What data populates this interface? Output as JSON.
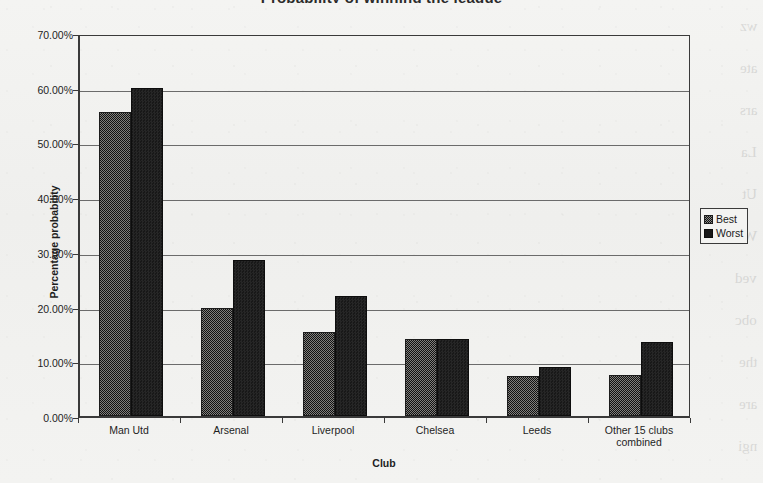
{
  "chart_data": {
    "type": "bar",
    "title": "Probability of winning the league",
    "xlabel": "Club",
    "ylabel": "Percentage probability",
    "categories": [
      "Man Utd",
      "Arsenal",
      "Liverpool",
      "Chelsea",
      "Leeds",
      "Other 15 clubs combined"
    ],
    "series": [
      {
        "name": "Best",
        "values": [
          55.5,
          19.8,
          15.3,
          14.1,
          7.4,
          7.5
        ]
      },
      {
        "name": "Worst",
        "values": [
          60.0,
          28.5,
          22.0,
          14.1,
          8.9,
          13.5
        ]
      }
    ],
    "ylim": [
      0,
      70
    ],
    "y_tick_labels": [
      "0.00%",
      "10.00%",
      "20.00%",
      "30.00%",
      "40.00%",
      "50.00%",
      "60.00%",
      "70.00%"
    ],
    "y_tick_values": [
      0,
      10,
      20,
      30,
      40,
      50,
      60,
      70
    ],
    "grid": true,
    "legend_position": "right"
  },
  "legend": {
    "entries": [
      {
        "label": "Best",
        "swatch": "hatched-dark-swatch"
      },
      {
        "label": "Worst",
        "swatch": "solid-black-swatch"
      }
    ]
  },
  "bleed_through": {
    "lines": [
      "wz",
      "ate",
      "ars",
      "La",
      "Ut",
      "W",
      "ved",
      "obc",
      "the",
      "are",
      "ngi"
    ]
  }
}
